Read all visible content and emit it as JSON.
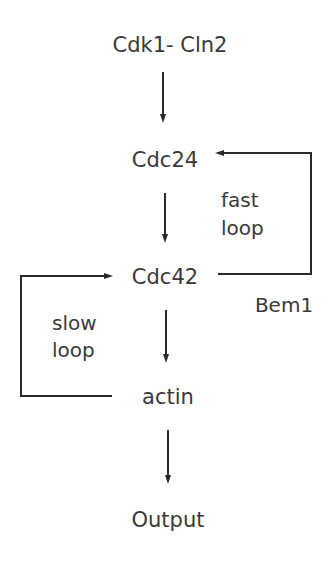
{
  "diagram": {
    "nodes": {
      "cdk1_cln2": "Cdk1- Cln2",
      "cdc24": "Cdc24",
      "cdc42": "Cdc42",
      "actin": "actin",
      "output": "Output"
    },
    "loops": {
      "fast": {
        "line1": "fast",
        "line2": "loop",
        "mediator": "Bem1",
        "from": "Cdc42",
        "to": "Cdc24"
      },
      "slow": {
        "line1": "slow",
        "line2": "loop",
        "from": "actin",
        "to": "Cdc42"
      }
    },
    "edges": [
      {
        "from": "Cdk1- Cln2",
        "to": "Cdc24"
      },
      {
        "from": "Cdc24",
        "to": "Cdc42"
      },
      {
        "from": "Cdc42",
        "to": "actin"
      },
      {
        "from": "actin",
        "to": "Output"
      }
    ],
    "colors": {
      "ink": "#2a2a2a",
      "text": "#3a3a3a",
      "background": "#ffffff"
    }
  }
}
